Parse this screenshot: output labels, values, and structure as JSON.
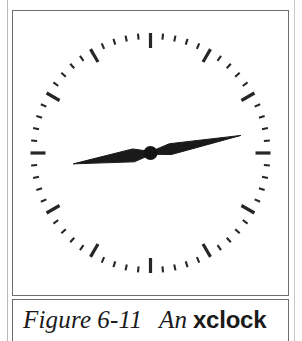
{
  "figure": {
    "label_prefix": "Figure",
    "number": "6-11",
    "description_lead": "An",
    "app_name": "xclock"
  },
  "clock": {
    "window_title": "xclock",
    "face_shape": "circle",
    "hands": [
      {
        "name": "hour-hand",
        "angle_deg": 262,
        "length_px": 78,
        "width_px": 13,
        "color": "#1a1a1a"
      },
      {
        "name": "minute-hand",
        "angle_deg": 79,
        "length_px": 92,
        "width_px": 11,
        "color": "#1a1a1a"
      }
    ],
    "hub": {
      "radius_px": 7,
      "color": "#141414"
    },
    "ticks": {
      "hour_count": 12,
      "minute_count": 60,
      "hour_tick_length_px": 15,
      "minute_tick_length_px": 6,
      "color": "#262626"
    },
    "reading": "9:16",
    "colors": {
      "foreground": "#141414",
      "background": "#ffffff",
      "border": "#6d6d6d",
      "page": "#ffffff"
    }
  }
}
